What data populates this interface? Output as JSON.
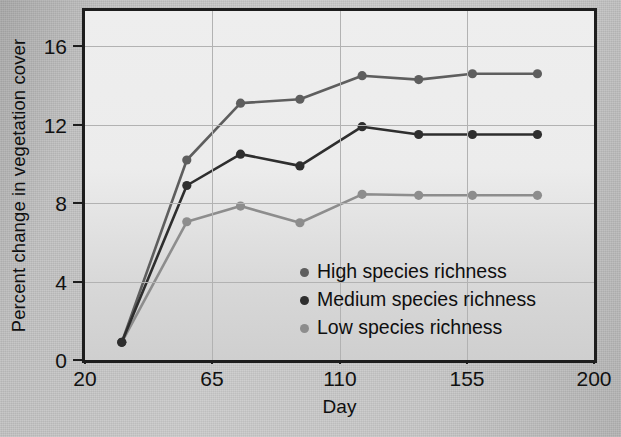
{
  "figure": {
    "xlabel": "Day",
    "ylabel": "Percent change in vegetation cover"
  },
  "axes": {
    "x_ticks": [
      "20",
      "65",
      "110",
      "155",
      "200"
    ],
    "y_ticks": [
      "0",
      "4",
      "8",
      "12",
      "16"
    ]
  },
  "legend": {
    "items": [
      {
        "label": "High species richness",
        "color": "#5e5e5e"
      },
      {
        "label": "Medium species richness",
        "color": "#2e2e2e"
      },
      {
        "label": "Low species richness",
        "color": "#8d8d8d"
      }
    ]
  },
  "chart_data": {
    "type": "line",
    "title": "",
    "xlabel": "Day",
    "ylabel": "Percent change in vegetation cover",
    "xlim": [
      20,
      200
    ],
    "ylim": [
      0,
      17.8
    ],
    "x_ticks": [
      20,
      65,
      110,
      155,
      200
    ],
    "y_ticks": [
      0,
      4,
      8,
      12,
      16
    ],
    "grid": true,
    "legend_position": "inside lower-right",
    "x": [
      33,
      56,
      75,
      96,
      118,
      138,
      157,
      180
    ],
    "series": [
      {
        "name": "High species richness",
        "color": "#5e5e5e",
        "values": [
          0.9,
          10.2,
          13.1,
          13.3,
          14.5,
          14.3,
          14.6,
          14.6
        ]
      },
      {
        "name": "Medium species richness",
        "color": "#2e2e2e",
        "values": [
          0.9,
          8.9,
          10.5,
          9.9,
          11.9,
          11.5,
          11.5,
          11.5
        ]
      },
      {
        "name": "Low species richness",
        "color": "#8d8d8d",
        "values": [
          0.9,
          7.05,
          7.85,
          7.0,
          8.45,
          8.4,
          8.4,
          8.4
        ]
      }
    ]
  }
}
